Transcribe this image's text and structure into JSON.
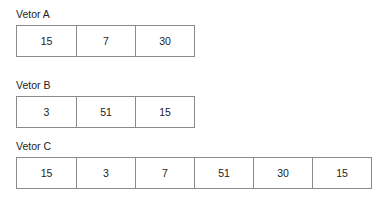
{
  "vectors": [
    {
      "label": "Vetor A",
      "values": [
        "15",
        "7",
        "30"
      ]
    },
    {
      "label": "Vetor B",
      "values": [
        "3",
        "51",
        "15"
      ]
    },
    {
      "label": "Vetor C",
      "values": [
        "15",
        "3",
        "7",
        "51",
        "30",
        "15"
      ]
    }
  ],
  "colors": {
    "border": "#8a8a8a",
    "text": "#222222",
    "background": "#ffffff"
  }
}
